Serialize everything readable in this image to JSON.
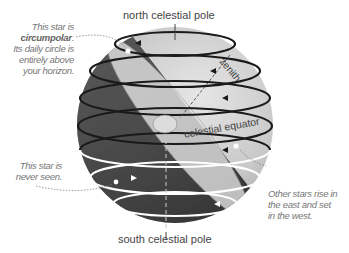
{
  "diagram": {
    "type": "celestial-sphere",
    "labels": {
      "north_pole": "north celestial pole",
      "south_pole": "south celestial pole",
      "zenith": "zenith",
      "equator": "celestial equator"
    },
    "notes": {
      "circumpolar": {
        "line1": "This star is",
        "bold": "circumpolar",
        "line2_suffix": ".",
        "line3": "Its daily circle is",
        "line4": "entirely above",
        "line5": "your horizon."
      },
      "never_seen": {
        "line1": "This star is",
        "line2": "never seen."
      },
      "rise_set": {
        "line1": "Other stars rise in",
        "line2": "the east and set",
        "line3": "in the west."
      }
    },
    "colors": {
      "sphere_light": "#d6d6d6",
      "sphere_dark": "#3a3a3a",
      "horizon_plane": "#e8e8e8",
      "visible_path": "#1a1a1a",
      "hidden_path": "#ffffff",
      "note_text": "#777777",
      "label_text": "#444444"
    }
  }
}
